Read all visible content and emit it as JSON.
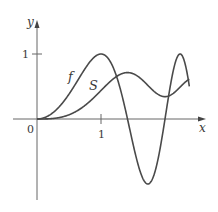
{
  "chart_data": {
    "type": "line",
    "title": "",
    "xlabel": "x",
    "ylabel": "y",
    "xlim": [
      0,
      2.6
    ],
    "ylim": [
      -1.2,
      1.5
    ],
    "x_ticks": [
      {
        "value": 0,
        "label": "0"
      },
      {
        "value": 1,
        "label": "1"
      }
    ],
    "y_ticks": [
      {
        "value": 1,
        "label": "1"
      }
    ],
    "grid": false,
    "legend": "curve labels placed on curves",
    "series": [
      {
        "name": "f",
        "label": "f",
        "formula": "sin(pi x^2 / 2)",
        "x": [
          0,
          0.2,
          0.4,
          0.6,
          0.8,
          1.0,
          1.2,
          1.4,
          1.6,
          1.732,
          1.8,
          2.0,
          2.2,
          2.236,
          2.4
        ],
        "values": [
          0,
          0.063,
          0.249,
          0.536,
          0.844,
          1.0,
          0.844,
          0.249,
          -0.809,
          -1.0,
          -0.951,
          0,
          0.951,
          1.0,
          0.536
        ]
      },
      {
        "name": "S",
        "label": "S",
        "formula": "integral_0^x sin(pi t^2 / 2) dt",
        "x": [
          0,
          0.2,
          0.4,
          0.6,
          0.8,
          1.0,
          1.2,
          1.4,
          1.6,
          1.8,
          2.0,
          2.2,
          2.4
        ],
        "values": [
          0,
          0.004,
          0.033,
          0.111,
          0.249,
          0.438,
          0.623,
          0.714,
          0.638,
          0.451,
          0.343,
          0.456,
          0.62
        ]
      }
    ]
  },
  "labels": {
    "y_axis": "y",
    "x_axis": "x",
    "origin": "0",
    "x_tick_1": "1",
    "y_tick_1": "1",
    "curve_f": "f",
    "curve_S": "S"
  },
  "colors": {
    "axis": "#555555",
    "curve": "#4a4a4a"
  }
}
